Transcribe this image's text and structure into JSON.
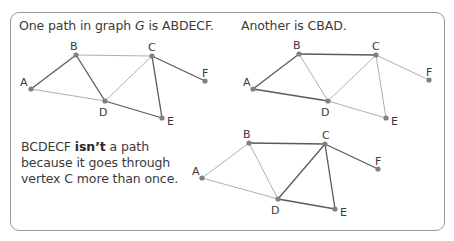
{
  "captions": {
    "first": {
      "prefix": "One path in graph ",
      "graph_name": "G",
      "suffix": " is ABDECF."
    },
    "second": {
      "text": "Another is CBAD."
    },
    "third": {
      "prefix": "BCDECF ",
      "emphasis": "isn’t",
      "suffix": " a path because it goes through vertex C more than once."
    }
  },
  "colors": {
    "highlight_edge": "#5a5a5a",
    "plain_edge": "#b0b0b0",
    "vertex": "#808080",
    "border": "#9a9a9a",
    "text": "#3a3a3a"
  },
  "graphs": [
    {
      "id": "graph-1",
      "path": "ABDECF",
      "vertices": [
        {
          "name": "A",
          "x": 31,
          "y": 89,
          "lx": 20,
          "ly": 86
        },
        {
          "name": "B",
          "x": 76,
          "y": 55,
          "lx": 70,
          "ly": 50
        },
        {
          "name": "C",
          "x": 152,
          "y": 56,
          "lx": 148,
          "ly": 51
        },
        {
          "name": "D",
          "x": 105,
          "y": 101,
          "lx": 99,
          "ly": 116
        },
        {
          "name": "E",
          "x": 162,
          "y": 118,
          "lx": 167,
          "ly": 125
        },
        {
          "name": "F",
          "x": 205,
          "y": 81,
          "lx": 202,
          "ly": 77
        }
      ],
      "edges": [
        {
          "from": "A",
          "to": "B",
          "highlight": true
        },
        {
          "from": "B",
          "to": "D",
          "highlight": true
        },
        {
          "from": "D",
          "to": "E",
          "highlight": true
        },
        {
          "from": "E",
          "to": "C",
          "highlight": true
        },
        {
          "from": "C",
          "to": "F",
          "highlight": true
        },
        {
          "from": "A",
          "to": "D",
          "highlight": false
        },
        {
          "from": "B",
          "to": "C",
          "highlight": false
        },
        {
          "from": "C",
          "to": "D",
          "highlight": false
        }
      ]
    },
    {
      "id": "graph-2",
      "path": "CBAD",
      "vertices": [
        {
          "name": "A",
          "x": 253,
          "y": 89,
          "lx": 243,
          "ly": 86
        },
        {
          "name": "B",
          "x": 299,
          "y": 54,
          "lx": 293,
          "ly": 49
        },
        {
          "name": "C",
          "x": 376,
          "y": 55,
          "lx": 372,
          "ly": 50
        },
        {
          "name": "D",
          "x": 328,
          "y": 101,
          "lx": 321,
          "ly": 116
        },
        {
          "name": "E",
          "x": 386,
          "y": 118,
          "lx": 391,
          "ly": 125
        },
        {
          "name": "F",
          "x": 429,
          "y": 80,
          "lx": 426,
          "ly": 76
        }
      ],
      "edges": [
        {
          "from": "C",
          "to": "B",
          "highlight": true
        },
        {
          "from": "B",
          "to": "A",
          "highlight": true
        },
        {
          "from": "A",
          "to": "D",
          "highlight": true
        },
        {
          "from": "B",
          "to": "D",
          "highlight": false
        },
        {
          "from": "C",
          "to": "D",
          "highlight": false
        },
        {
          "from": "C",
          "to": "E",
          "highlight": false
        },
        {
          "from": "C",
          "to": "F",
          "highlight": false
        },
        {
          "from": "D",
          "to": "E",
          "highlight": false
        }
      ]
    },
    {
      "id": "graph-3",
      "path": "BCDECF",
      "vertices": [
        {
          "name": "A",
          "x": 202,
          "y": 178,
          "lx": 192,
          "ly": 175
        },
        {
          "name": "B",
          "x": 249,
          "y": 143,
          "lx": 243,
          "ly": 138
        },
        {
          "name": "C",
          "x": 325,
          "y": 144,
          "lx": 322,
          "ly": 139
        },
        {
          "name": "D",
          "x": 278,
          "y": 199,
          "lx": 271,
          "ly": 214
        },
        {
          "name": "E",
          "x": 335,
          "y": 209,
          "lx": 340,
          "ly": 216
        },
        {
          "name": "F",
          "x": 378,
          "y": 169,
          "lx": 375,
          "ly": 165
        }
      ],
      "edges": [
        {
          "from": "B",
          "to": "C",
          "highlight": true
        },
        {
          "from": "C",
          "to": "D",
          "highlight": true
        },
        {
          "from": "D",
          "to": "E",
          "highlight": true
        },
        {
          "from": "E",
          "to": "C",
          "highlight": true
        },
        {
          "from": "C",
          "to": "F",
          "highlight": true
        },
        {
          "from": "A",
          "to": "B",
          "highlight": false
        },
        {
          "from": "A",
          "to": "D",
          "highlight": false
        },
        {
          "from": "B",
          "to": "D",
          "highlight": false
        }
      ]
    }
  ]
}
